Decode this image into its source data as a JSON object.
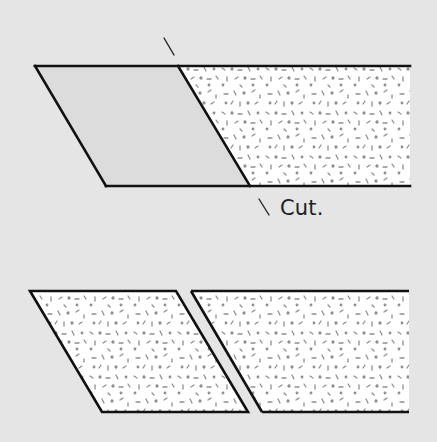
{
  "diagram": {
    "title": "",
    "cut_label": "Cut.",
    "colors": {
      "background": "#e5e5e5",
      "cut_piece_fill": "#dcdcdc",
      "fabric_fill": "#ffffff",
      "speckle": "#8a8a8a",
      "outline": "#111111"
    },
    "top_strip": {
      "description": "Fabric strip with a parallelogram piece marked for cutting",
      "top_edge_y": 66,
      "bottom_edge_y": 186,
      "left_top_x": 35,
      "left_bottom_x": 106,
      "right_x": 410,
      "cut_line": {
        "from": [
          178,
          66
        ],
        "to": [
          250,
          186
        ]
      },
      "cut_tick_top": {
        "from": [
          164,
          38
        ],
        "to": [
          174,
          55
        ]
      },
      "cut_tick_bottom": {
        "from": [
          259,
          199
        ],
        "to": [
          269,
          215
        ]
      }
    },
    "bottom_pieces": [
      {
        "name": "cut-piece",
        "points": [
          [
            30,
            291
          ],
          [
            176,
            291
          ],
          [
            248,
            412
          ],
          [
            102,
            412
          ]
        ]
      },
      {
        "name": "remaining-strip",
        "points": [
          [
            191,
            291
          ],
          [
            409,
            291
          ],
          [
            409,
            412
          ],
          [
            262,
            412
          ]
        ]
      }
    ]
  }
}
